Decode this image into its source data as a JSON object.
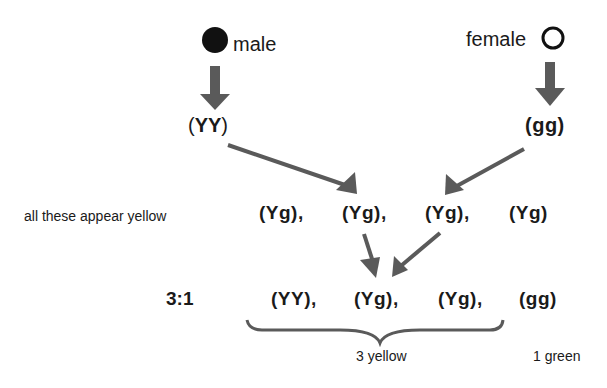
{
  "parents": {
    "male": {
      "label": "male",
      "symbol": "filled-circle",
      "genotype_open": "(",
      "genotype_bold": "YY",
      "genotype_close": ")"
    },
    "female": {
      "label": "female",
      "symbol": "open-circle",
      "genotype": "(gg)"
    }
  },
  "f1": {
    "caption": "all these appear yellow",
    "genotypes": [
      "(Yg),",
      "(Yg),",
      "(Yg),",
      "(Yg)"
    ]
  },
  "f2": {
    "ratio": "3:1",
    "genotypes": [
      "(YY),",
      "(Yg),",
      "(Yg),",
      "(gg)"
    ],
    "yellow_label": "3 yellow",
    "green_label": "1 green"
  },
  "colors": {
    "arrow": "#5a5a5a",
    "text": "#1a1a1a"
  }
}
